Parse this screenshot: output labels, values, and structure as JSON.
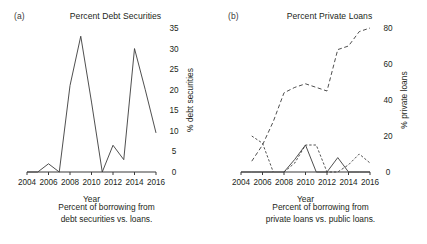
{
  "figure": {
    "background_color": "#ffffff",
    "line_color": "#3b3b3b",
    "text_color": "#231f20"
  },
  "panels": [
    {
      "tag": "(a)",
      "title": "Percent Debt Securities",
      "caption_line1": "Percent of borrowing from",
      "caption_line2": "debt securities vs. loans."
    },
    {
      "tag": "(b)",
      "title": "Percent Private Loans",
      "caption_line1": "Percent of borrowing from",
      "caption_line2": "private loans vs. public loans."
    }
  ],
  "chart_data": [
    {
      "type": "line",
      "title": "Percent Debt Securities",
      "panel": "(a)",
      "xlabel": "Year",
      "ylabel": "% debt securities",
      "xlim": [
        2004,
        2016
      ],
      "ylim": [
        0,
        35
      ],
      "xticks": [
        2004,
        2006,
        2008,
        2010,
        2012,
        2014,
        2016
      ],
      "yticks": [
        0,
        5,
        10,
        15,
        20,
        25,
        30,
        35
      ],
      "xtick_labels": [
        "2004",
        "2006",
        "2008",
        "2010",
        "2012",
        "2014",
        "2016"
      ],
      "ytick_labels": [
        "0",
        "5",
        "10",
        "15",
        "20",
        "25",
        "30",
        "35"
      ],
      "grid": false,
      "legend": "none",
      "yaxis_position": "right",
      "series": [
        {
          "name": "% debt securities",
          "style": "solid",
          "x": [
            2004,
            2005,
            2006,
            2007,
            2008,
            2009,
            2010,
            2011,
            2012,
            2013,
            2014,
            2015,
            2016
          ],
          "values": [
            0,
            0,
            2,
            0,
            21,
            33,
            17,
            0,
            6.5,
            3,
            30,
            20,
            9.5
          ]
        }
      ]
    },
    {
      "type": "line",
      "title": "Percent Private Loans",
      "panel": "(b)",
      "xlabel": "Year",
      "ylabel": "% private loans",
      "xlim": [
        2004,
        2016
      ],
      "ylim": [
        0,
        80
      ],
      "xticks": [
        2004,
        2006,
        2008,
        2010,
        2012,
        2014,
        2016
      ],
      "yticks": [
        0,
        20,
        40,
        60,
        80
      ],
      "xtick_labels": [
        "2004",
        "2006",
        "2008",
        "2010",
        "2012",
        "2014",
        "2016"
      ],
      "ytick_labels": [
        "0",
        "20",
        "40",
        "60",
        "80"
      ],
      "grid": false,
      "legend": "none",
      "yaxis_position": "right",
      "series": [
        {
          "name": "private loans trend",
          "style": "dashed",
          "x": [
            2005,
            2006,
            2007,
            2008,
            2009,
            2010,
            2011,
            2012,
            2013,
            2014,
            2015,
            2016
          ],
          "values": [
            6,
            15,
            28,
            44,
            47,
            49,
            47,
            45,
            68,
            70,
            78,
            80
          ]
        },
        {
          "name": "declining series",
          "style": "dashed-short",
          "x": [
            2005,
            2006,
            2007
          ],
          "values": [
            20,
            16,
            0
          ]
        },
        {
          "name": "episodic series",
          "style": "dashed-short",
          "x": [
            2008,
            2009,
            2010,
            2011,
            2012,
            2013,
            2014,
            2015,
            2016
          ],
          "values": [
            0,
            5,
            15,
            15,
            0,
            0,
            4,
            10,
            5
          ]
        },
        {
          "name": "public loans",
          "style": "solid",
          "x": [
            2004,
            2005,
            2006,
            2007,
            2008,
            2009,
            2010,
            2011,
            2012,
            2013,
            2014,
            2015,
            2016
          ],
          "values": [
            0,
            0,
            0,
            0,
            0,
            7,
            15,
            0,
            0,
            8,
            0,
            0,
            0
          ]
        }
      ]
    }
  ]
}
